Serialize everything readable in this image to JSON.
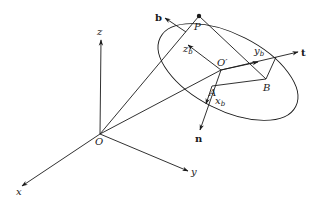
{
  "diagram": {
    "title": "",
    "labels": {
      "x_axis": "x",
      "y_axis": "y",
      "z_axis": "z",
      "origin": "O",
      "origin_prime": "O′",
      "point_p": "P",
      "point_a": "A",
      "point_b": "B",
      "vec_b": "b",
      "vec_t": "t",
      "vec_n": "n",
      "x_b": "x",
      "y_b": "y",
      "z_b": "z",
      "sub_b": "b"
    },
    "points": {
      "O": [
        100,
        134
      ],
      "O_prime": [
        221,
        70
      ],
      "P": [
        199,
        16
      ],
      "A": [
        212,
        86
      ],
      "B": [
        266,
        79
      ]
    },
    "colors": {
      "ink": "#1a1a1a",
      "background": "#ffffff"
    }
  }
}
